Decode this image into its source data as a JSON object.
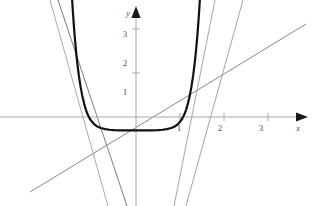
{
  "figure": {
    "kind": "math-graph",
    "background_color": "#ffffff",
    "width": 318,
    "height": 206
  },
  "axes": {
    "x_axis": {
      "name": "x",
      "color": "#a8a8a8",
      "arrow": true,
      "tick_labels": [
        "1",
        "2",
        "3"
      ]
    },
    "y_axis": {
      "name": "y",
      "color": "#a8a8a8",
      "arrow": true,
      "tick_labels": [
        "1",
        "2",
        "3"
      ]
    },
    "origin_px": [
      136,
      117
    ],
    "unit_px": 44,
    "x_range": [
      -3.1,
      3.9
    ],
    "y_range": [
      -2.0,
      2.5
    ],
    "grid": false,
    "legend": false
  },
  "chart_data": {
    "type": "line",
    "title": "",
    "xlabel": "x",
    "ylabel": "y",
    "xlim": [
      -3.1,
      3.9
    ],
    "ylim": [
      -2.0,
      2.5
    ],
    "x_ticks": [
      1,
      2,
      3
    ],
    "y_ticks": [
      1,
      2,
      3
    ],
    "grid": false,
    "legend_position": "none",
    "series": [
      {
        "name": "curve",
        "label": "",
        "kind": "curve",
        "color": "#111111",
        "width": 2.2,
        "description": "steep even U-shaped curve, vertex near (0,-0.1), rises off top of frame near x=-1.45 and x=1.4",
        "points": [
          [
            -1.45,
            2.64
          ],
          [
            -1.43,
            2.33
          ],
          [
            -1.41,
            2.05
          ],
          [
            -1.39,
            1.8
          ],
          [
            -1.36,
            1.47
          ],
          [
            -1.33,
            1.19
          ],
          [
            -1.3,
            0.95
          ],
          [
            -1.26,
            0.69
          ],
          [
            -1.22,
            0.48
          ],
          [
            -1.18,
            0.31
          ],
          [
            -1.14,
            0.17
          ],
          [
            -1.1,
            0.06
          ],
          [
            -1.05,
            -0.04
          ],
          [
            -1.0,
            -0.11
          ],
          [
            -0.94,
            -0.175
          ],
          [
            -0.88,
            -0.215
          ],
          [
            -0.8,
            -0.25
          ],
          [
            -0.7,
            -0.275
          ],
          [
            -0.6,
            -0.29
          ],
          [
            -0.5,
            -0.298
          ],
          [
            -0.35,
            -0.303
          ],
          [
            -0.2,
            -0.305
          ],
          [
            0.0,
            -0.306
          ],
          [
            0.2,
            -0.305
          ],
          [
            0.35,
            -0.303
          ],
          [
            0.5,
            -0.298
          ],
          [
            0.6,
            -0.29
          ],
          [
            0.7,
            -0.275
          ],
          [
            0.8,
            -0.25
          ],
          [
            0.88,
            -0.215
          ],
          [
            0.94,
            -0.175
          ],
          [
            1.0,
            -0.11
          ],
          [
            1.05,
            -0.04
          ],
          [
            1.1,
            0.06
          ],
          [
            1.14,
            0.17
          ],
          [
            1.18,
            0.31
          ],
          [
            1.22,
            0.48
          ],
          [
            1.26,
            0.69
          ],
          [
            1.3,
            0.95
          ],
          [
            1.33,
            1.19
          ],
          [
            1.36,
            1.47
          ],
          [
            1.39,
            1.8
          ],
          [
            1.41,
            2.05
          ],
          [
            1.43,
            2.33
          ],
          [
            1.45,
            2.64
          ]
        ]
      },
      {
        "name": "line-shallow",
        "label": "",
        "kind": "line",
        "color": "#7a7a7a",
        "width": 0.9,
        "description": "gently rising secant line crossing the curve near x=1.05",
        "p1_px": [
          30,
          192
        ],
        "p2_px": [
          306,
          24
        ]
      },
      {
        "name": "line-steep-a",
        "label": "",
        "kind": "line",
        "color": "#9a9a9a",
        "width": 0.9,
        "description": "steep positive-slope line through the right side of the curve",
        "p1_px": [
          186,
          206
        ],
        "p2_px": [
          243,
          0
        ]
      },
      {
        "name": "line-steep-b",
        "label": "",
        "kind": "line",
        "color": "#9a9a9a",
        "width": 0.9,
        "description": "steeper positive-slope line through the right side of the curve",
        "p1_px": [
          174,
          206
        ],
        "p2_px": [
          215,
          0
        ]
      },
      {
        "name": "line-steep-c",
        "label": "",
        "kind": "line",
        "color": "#6d6d6d",
        "width": 0.9,
        "description": "near-vertical negative-slope line from upper-left to lower-right",
        "p1_px": [
          58,
          0
        ],
        "p2_px": [
          127,
          206
        ]
      },
      {
        "name": "line-steep-d",
        "label": "",
        "kind": "line",
        "color": "#a0a0a0",
        "width": 0.9,
        "description": "near-vertical negative-slope line from upper-left to lower-right, shallower",
        "p1_px": [
          50,
          0
        ],
        "p2_px": [
          108,
          206
        ]
      }
    ],
    "annotations": [
      {
        "text": "y",
        "role": "y-axis-name",
        "x_px": 128,
        "y_px": 16
      },
      {
        "text": "x",
        "role": "x-axis-name",
        "x_px": 298,
        "y_px": 131
      },
      {
        "text": "3",
        "role": "y-tick",
        "x_px": 125,
        "y_px": 37
      },
      {
        "text": "2",
        "role": "y-tick",
        "x_px": 125,
        "y_px": 66
      },
      {
        "text": "1",
        "role": "y-tick",
        "x_px": 125,
        "y_px": 95
      },
      {
        "text": "1",
        "role": "x-tick",
        "x_px": 179,
        "y_px": 131
      },
      {
        "text": "2",
        "role": "x-tick",
        "x_px": 220,
        "y_px": 131
      },
      {
        "text": "3",
        "role": "x-tick",
        "x_px": 261,
        "y_px": 131
      }
    ]
  }
}
